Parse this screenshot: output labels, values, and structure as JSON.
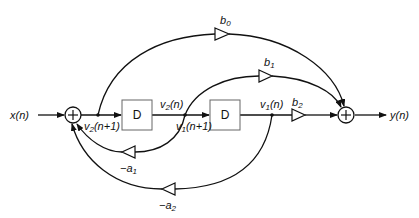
{
  "diagram": {
    "type": "signal-flow block diagram (direct form II, second-order IIR filter)",
    "input": {
      "label": "x(n)",
      "base": "x",
      "arg": "(n)"
    },
    "output": {
      "label": "y(n)",
      "base": "y",
      "arg": "(n)"
    },
    "adders": [
      {
        "id": "input-adder",
        "symbol": "+"
      },
      {
        "id": "output-adder",
        "symbol": "+"
      }
    ],
    "delays": [
      {
        "id": "delay-1",
        "label": "D"
      },
      {
        "id": "delay-2",
        "label": "D"
      }
    ],
    "signals": {
      "v2_n1": {
        "base": "v",
        "sub": "2",
        "arg": "(n+1)"
      },
      "v2_n": {
        "base": "v",
        "sub": "2",
        "arg": "(n)"
      },
      "v1_n1": {
        "base": "v",
        "sub": "1",
        "arg": "(n+1)"
      },
      "v1_n": {
        "base": "v",
        "sub": "1",
        "arg": "(n)"
      }
    },
    "gains": {
      "b0": {
        "prefix": "",
        "base": "b",
        "sub": "0"
      },
      "b1": {
        "prefix": "",
        "base": "b",
        "sub": "1"
      },
      "b2": {
        "prefix": "",
        "base": "b",
        "sub": "2"
      },
      "a1": {
        "prefix": "−",
        "base": "a",
        "sub": "1"
      },
      "a2": {
        "prefix": "−",
        "base": "a",
        "sub": "2"
      }
    },
    "colors": {
      "line": "#111111",
      "box_border": "#666666",
      "background": "#ffffff"
    }
  }
}
